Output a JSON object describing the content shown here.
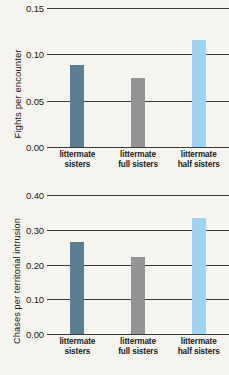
{
  "chart_data": [
    {
      "type": "bar",
      "title": "",
      "xlabel": "",
      "ylabel": "Fights per encounter",
      "ylim": [
        0.0,
        0.15
      ],
      "yticks": [
        "0.00",
        "0.05",
        "0.10",
        "0.15"
      ],
      "ytick_values": [
        0.0,
        0.05,
        0.1,
        0.15
      ],
      "grid": true,
      "legend": "none",
      "categories": [
        "littermate sisters",
        "littermate full sisters",
        "littermate half sisters"
      ],
      "category_lines": [
        [
          "littermate",
          "sisters"
        ],
        [
          "littermate",
          "full sisters"
        ],
        [
          "littermate",
          "half sisters"
        ]
      ],
      "values": [
        0.088,
        0.075,
        0.115
      ],
      "colors": [
        "#5d7e91",
        "#949494",
        "#9ed4ef"
      ]
    },
    {
      "type": "bar",
      "title": "",
      "xlabel": "",
      "ylabel": "Chases per territorial intrusion",
      "ylim": [
        0.0,
        0.4
      ],
      "yticks": [
        "0.00",
        "0.10",
        "0.20",
        "0.30",
        "0.40"
      ],
      "ytick_values": [
        0.0,
        0.1,
        0.2,
        0.3,
        0.4
      ],
      "grid": true,
      "legend": "none",
      "categories": [
        "littermate sisters",
        "littermate full sisters",
        "littermate half sisters"
      ],
      "category_lines": [
        [
          "littermate",
          "sisters"
        ],
        [
          "littermate",
          "full sisters"
        ],
        [
          "littermate",
          "half sisters"
        ]
      ],
      "values": [
        0.265,
        0.222,
        0.335
      ],
      "colors": [
        "#5d7e91",
        "#949494",
        "#9ed4ef"
      ]
    }
  ],
  "figure": {
    "background_color": "#f6f4ef",
    "axis_color": "#3a3a3a",
    "text_color": "#1a1a1a"
  }
}
